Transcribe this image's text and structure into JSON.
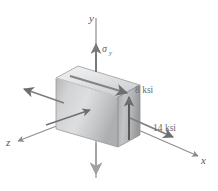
{
  "figure": {
    "background_color": "#ffffff",
    "axes": {
      "y_label": "y",
      "x_label": "x",
      "z_label": "z",
      "axis_color": "#7b7b7d"
    },
    "labels": {
      "sigma_y": "σ",
      "sigma_y_sub": "y",
      "shear_8ksi": "8 ksi",
      "normal_14ksi": "14 ksi"
    },
    "block": {
      "front_face_color": "#c9cacb",
      "top_face_color": "#e3e4e5",
      "right_face_color": "#b4b5b6",
      "edge_color": "#8d8e90"
    },
    "arrows": {
      "sigma_y_up": "vertical-up-arrow",
      "sigma_y_down": "vertical-down-arrow",
      "top_face_shear": "top-face-shear-arrow",
      "right_face_shear": "right-face-shear-arrow",
      "left_face_normal": "left-face-normal-arrow",
      "right_face_normal": "right-face-normal-arrow",
      "front_face_normal": "front-face-pointer-arrow"
    }
  }
}
